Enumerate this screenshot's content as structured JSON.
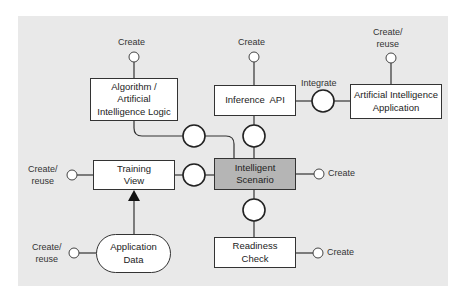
{
  "diagram": {
    "title": "",
    "nodes": {
      "algorithm": {
        "label": "Algorithm / Artificial Intelligence Logic",
        "line1": "Algorithm /",
        "line2": "Artificial",
        "line3": "Intelligence Logic",
        "fill": "white"
      },
      "inference": {
        "label": "Inference  API",
        "fill": "white"
      },
      "ai_app": {
        "label": "Artificial Intelligence Application",
        "line1": "Artificial Intelligence",
        "line2": "Application",
        "fill": "white"
      },
      "training": {
        "label": "Training View",
        "line1": "Training",
        "line2": "View",
        "fill": "white"
      },
      "scenario": {
        "label": "Intelligent Scenario",
        "line1": "Intelligent",
        "line2": "Scenario",
        "fill": "#b5b5b5"
      },
      "app_data": {
        "label": "Application Data",
        "line1": "Application",
        "line2": "Data",
        "shape": "stadium",
        "fill": "white"
      },
      "readiness": {
        "label": "Readiness Check",
        "line1": "Readiness",
        "line2": "Check",
        "fill": "white"
      }
    },
    "lifecycle_labels": {
      "algorithm": "Create",
      "inference": "Create",
      "ai_app_1": "Create/",
      "ai_app_2": "reuse",
      "training_1": "Create/",
      "training_2": "reuse",
      "scenario": "Create",
      "app_data_1": "Create/",
      "app_data_2": "reuse",
      "readiness": "Create"
    },
    "connector_labels": {
      "integrate": "Integrate"
    },
    "edges": [
      {
        "from": "algorithm",
        "to": "scenario",
        "via": "interface-circle"
      },
      {
        "from": "inference",
        "to": "scenario",
        "via": "interface-circle"
      },
      {
        "from": "inference",
        "to": "ai_app",
        "via": "interface-circle",
        "label": "Integrate"
      },
      {
        "from": "training",
        "to": "scenario",
        "via": "interface-circle"
      },
      {
        "from": "scenario",
        "to": "readiness",
        "via": "interface-circle"
      },
      {
        "from": "app_data",
        "to": "training",
        "type": "arrow"
      }
    ],
    "colors": {
      "background": "#e9e9e9",
      "highlight": "#b5b5b5",
      "stroke": "#333333"
    }
  }
}
